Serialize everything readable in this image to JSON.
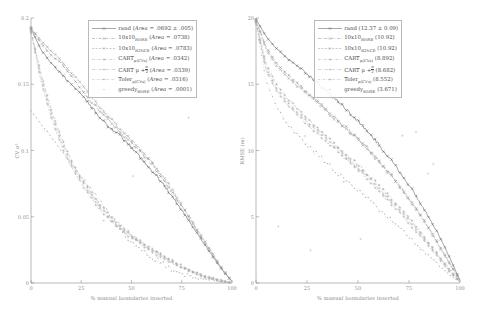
{
  "figure": {
    "panels": [
      {
        "id": "left",
        "ylabel": "CV σ²",
        "xlabel": "% manual boundaries inserted",
        "xticks": [
          "0",
          "25",
          "50",
          "75",
          "100"
        ],
        "yticks": [
          "0.2",
          "0.15",
          "0.1",
          "0.05",
          "0"
        ],
        "legend": [
          {
            "name": "rand",
            "sub": "",
            "metric": "Area",
            "value": ".0692 ± .005",
            "style": "solid-marker"
          },
          {
            "name": "10x10",
            "sub": "RMSE",
            "metric": "Area",
            "value": ".0738",
            "style": "dashdot-marker"
          },
          {
            "name": "10x10",
            "sub": "R2NCE",
            "metric": "Area",
            "value": ".0783",
            "style": "dashed-marker"
          },
          {
            "name": "CART",
            "sub": "μ(CVs)",
            "metric": "Area",
            "value": ".0342",
            "style": "dashdot-sparse"
          },
          {
            "name": "CART μ + σ/2",
            "sub": "",
            "metric": "Area",
            "value": ".0339",
            "style": "dashdot-sparse2"
          },
          {
            "name": "Toler",
            "sub": "μ(CVs)",
            "metric": "Area",
            "value": ".0316",
            "style": "dashdot-sparse3"
          },
          {
            "name": "greedy",
            "sub": "RMSE",
            "metric": "Area",
            "value": ".0001",
            "style": "dots-only"
          }
        ]
      },
      {
        "id": "right",
        "ylabel": "RMSE (m)",
        "xlabel": "% manual boundaries inserted",
        "xticks": [
          "0",
          "25",
          "50",
          "75",
          "100"
        ],
        "yticks": [
          "20",
          "15",
          "10",
          "5",
          "0"
        ],
        "legend": [
          {
            "name": "rand",
            "sub": "",
            "metric": "",
            "value": "12.37 ± 0.09",
            "style": "solid-marker"
          },
          {
            "name": "10x10",
            "sub": "RMSE",
            "metric": "",
            "value": "10.92",
            "style": "dashdot-marker"
          },
          {
            "name": "10x10",
            "sub": "R2NCE",
            "metric": "",
            "value": "10.92",
            "style": "dashed-marker"
          },
          {
            "name": "CART",
            "sub": "μ(CVs)",
            "metric": "",
            "value": "8.892",
            "style": "dashdot-sparse"
          },
          {
            "name": "CART μ + σ/2",
            "sub": "",
            "metric": "",
            "value": "8.682",
            "style": "dashdot-sparse2"
          },
          {
            "name": "Toler",
            "sub": "μ(CVs)",
            "metric": "",
            "value": "8.552",
            "style": "dashdot-sparse3"
          },
          {
            "name": "greedy",
            "sub": "RMSE",
            "metric": "",
            "value": "3.671",
            "style": "dots-only"
          }
        ]
      }
    ]
  },
  "chart_data": [
    {
      "type": "line",
      "title": "",
      "xlabel": "% manual boundaries inserted",
      "ylabel": "CV σ²",
      "xlim": [
        0,
        100
      ],
      "ylim": [
        0,
        0.2
      ],
      "xticks": [
        0,
        25,
        50,
        75,
        100
      ],
      "yticks": [
        0,
        0.05,
        0.1,
        0.15,
        0.2
      ],
      "grid": false,
      "legend_position": "top-right",
      "legend_entries": [
        "rand (Area = .0692 ± .005)",
        "10x10_RMSE (Area = .0738)",
        "10x10_R2NCE (Area = .0783)",
        "CART μ(CVs) (Area = .0342)",
        "CART μ + σ/2 (Area = .0339)",
        "Toler μ(CVs) (Area = .0316)",
        "greedy_RMSE (Area = .0001)"
      ],
      "x": [
        0,
        5,
        10,
        15,
        20,
        25,
        30,
        35,
        40,
        45,
        50,
        55,
        60,
        65,
        70,
        75,
        80,
        85,
        90,
        95,
        100
      ],
      "series": [
        {
          "name": "rand",
          "values": [
            0.192,
            0.176,
            0.166,
            0.158,
            0.15,
            0.142,
            0.133,
            0.124,
            0.116,
            0.11,
            0.102,
            0.094,
            0.085,
            0.076,
            0.066,
            0.055,
            0.044,
            0.032,
            0.021,
            0.01,
            0.001
          ]
        },
        {
          "name": "10x10_RMSE",
          "values": [
            0.193,
            0.181,
            0.172,
            0.166,
            0.156,
            0.147,
            0.137,
            0.129,
            0.121,
            0.112,
            0.106,
            0.098,
            0.09,
            0.08,
            0.069,
            0.058,
            0.046,
            0.034,
            0.022,
            0.011,
            0.001
          ]
        },
        {
          "name": "10x10_R2NCE",
          "values": [
            0.192,
            0.183,
            0.175,
            0.168,
            0.159,
            0.151,
            0.14,
            0.132,
            0.123,
            0.115,
            0.108,
            0.1,
            0.091,
            0.082,
            0.071,
            0.059,
            0.047,
            0.035,
            0.023,
            0.011,
            0.001
          ]
        },
        {
          "name": "CART μ(CVs)",
          "values": [
            0.19,
            0.158,
            0.131,
            0.11,
            0.093,
            0.079,
            0.068,
            0.058,
            0.05,
            0.043,
            0.036,
            0.031,
            0.026,
            0.021,
            0.017,
            0.013,
            0.009,
            0.006,
            0.004,
            0.002,
            0.0
          ]
        },
        {
          "name": "CART μ + σ/2",
          "values": [
            0.19,
            0.155,
            0.128,
            0.107,
            0.09,
            0.077,
            0.066,
            0.056,
            0.048,
            0.041,
            0.035,
            0.03,
            0.025,
            0.02,
            0.016,
            0.012,
            0.009,
            0.006,
            0.003,
            0.002,
            0.0
          ]
        },
        {
          "name": "Toler μ(CVs)",
          "values": [
            0.189,
            0.152,
            0.125,
            0.104,
            0.088,
            0.075,
            0.064,
            0.054,
            0.046,
            0.04,
            0.034,
            0.029,
            0.024,
            0.019,
            0.015,
            0.012,
            0.008,
            0.005,
            0.003,
            0.001,
            0.0
          ]
        },
        {
          "name": "greedy_RMSE",
          "values": [
            0.13,
            0.12,
            0.11,
            0.1,
            0.09,
            0.08,
            0.07,
            0.06,
            0.05,
            0.04,
            0.03,
            0.025,
            0.02,
            0.015,
            0.01,
            0.007,
            0.005,
            0.003,
            0.002,
            0.001,
            0.0
          ]
        }
      ]
    },
    {
      "type": "line",
      "title": "",
      "xlabel": "% manual boundaries inserted",
      "ylabel": "RMSE (m)",
      "xlim": [
        0,
        100
      ],
      "ylim": [
        0,
        20
      ],
      "xticks": [
        0,
        25,
        50,
        75,
        100
      ],
      "yticks": [
        0,
        5,
        10,
        15,
        20
      ],
      "grid": false,
      "legend_position": "top-right",
      "legend_entries": [
        "rand (12.37 ± 0.09)",
        "10x10_RMSE (10.92)",
        "10x10_R2NCE (10.92)",
        "CART μ(CVs) (8.892)",
        "CART μ + σ/2 (8.682)",
        "Toler μ(CVs) (8.552)",
        "greedy_RMSE (3.671)"
      ],
      "x": [
        0,
        5,
        10,
        15,
        20,
        25,
        30,
        35,
        40,
        45,
        50,
        55,
        60,
        65,
        70,
        75,
        80,
        85,
        90,
        95,
        100
      ],
      "series": [
        {
          "name": "rand",
          "values": [
            19.9,
            18.6,
            17.7,
            17.0,
            16.4,
            15.8,
            15.1,
            14.4,
            13.7,
            13.0,
            12.2,
            11.4,
            10.5,
            9.5,
            8.5,
            7.4,
            6.2,
            4.9,
            3.5,
            1.9,
            0.2
          ]
        },
        {
          "name": "10x10_RMSE",
          "values": [
            19.8,
            17.8,
            16.6,
            15.8,
            15.1,
            14.4,
            13.7,
            13.0,
            12.3,
            11.6,
            10.9,
            10.1,
            9.3,
            8.4,
            7.4,
            6.4,
            5.3,
            4.1,
            2.8,
            1.5,
            0.2
          ]
        },
        {
          "name": "10x10_R2NCE",
          "values": [
            19.8,
            17.6,
            16.4,
            15.6,
            14.9,
            14.3,
            13.6,
            12.9,
            12.2,
            11.5,
            10.8,
            10.0,
            9.2,
            8.3,
            7.3,
            6.3,
            5.2,
            4.0,
            2.7,
            1.4,
            0.2
          ]
        },
        {
          "name": "CART μ(CVs)",
          "values": [
            19.7,
            16.5,
            15.0,
            14.0,
            13.2,
            12.4,
            11.7,
            11.0,
            10.3,
            9.6,
            8.9,
            8.2,
            7.4,
            6.6,
            5.8,
            4.9,
            4.0,
            3.0,
            2.0,
            1.0,
            0.1
          ]
        },
        {
          "name": "CART μ + σ/2",
          "values": [
            19.7,
            16.2,
            14.7,
            13.7,
            12.9,
            12.2,
            11.5,
            10.8,
            10.1,
            9.4,
            8.7,
            8.0,
            7.2,
            6.4,
            5.6,
            4.7,
            3.8,
            2.9,
            1.9,
            0.9,
            0.1
          ]
        },
        {
          "name": "Toler μ(CVs)",
          "values": [
            19.6,
            16.0,
            14.5,
            13.5,
            12.7,
            12.0,
            11.3,
            10.6,
            9.9,
            9.2,
            8.6,
            7.8,
            7.0,
            6.2,
            5.4,
            4.5,
            3.6,
            2.7,
            1.8,
            0.8,
            0.1
          ]
        },
        {
          "name": "greedy_RMSE",
          "values": [
            19.5,
            15.2,
            13.3,
            12.1,
            11.2,
            10.4,
            9.7,
            9.0,
            8.3,
            7.6,
            7.0,
            6.3,
            5.6,
            4.9,
            4.2,
            3.5,
            2.7,
            2.0,
            1.3,
            0.6,
            0.1
          ]
        }
      ]
    }
  ]
}
